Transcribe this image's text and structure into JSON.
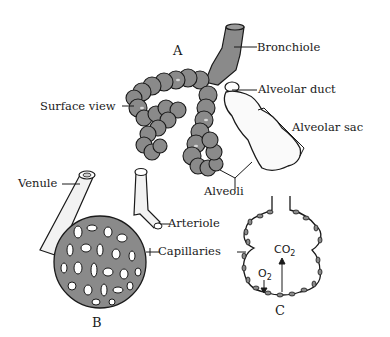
{
  "diagram": {
    "colors": {
      "tissue_gray": "#8a8a8a",
      "outline": "#1a1a1a",
      "background": "#ffffff",
      "sac_white": "#fafafa"
    },
    "panels": {
      "A": "A",
      "B": "B",
      "C": "C"
    },
    "labels": {
      "bronchiole": "Bronchiole",
      "alveolar_duct": "Alveolar duct",
      "surface_view": "Surface view",
      "alveolar_sac": "Alveolar sac",
      "alveoli": "Alveoli",
      "venule": "Venule",
      "arteriole": "Arteriole",
      "capillaries": "Capillaries"
    },
    "gases": {
      "co2_base": "CO",
      "co2_sub": "2",
      "o2_base": "O",
      "o2_sub": "2"
    }
  }
}
